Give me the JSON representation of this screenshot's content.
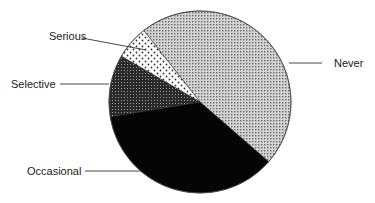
{
  "chart_data": {
    "type": "pie",
    "title": "",
    "center": [
      200,
      102
    ],
    "radius": 91,
    "start_angle_deg": -41,
    "slices": [
      {
        "label": "Never",
        "value": 47,
        "pattern": "light-dots"
      },
      {
        "label": "Serious",
        "value": 6,
        "pattern": "sparse-dots"
      },
      {
        "label": "Selective",
        "value": 11,
        "pattern": "dark-dots"
      },
      {
        "label": "Occasional",
        "value": 36,
        "pattern": "solid-black"
      }
    ],
    "legend": "callout labels with leader lines"
  },
  "labels": {
    "never": "Never",
    "serious": "Serious",
    "selective": "Selective",
    "occasional": "Occasional"
  }
}
